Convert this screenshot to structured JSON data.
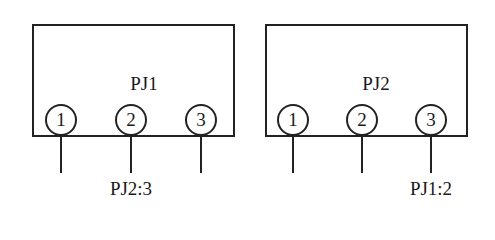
{
  "connectors": [
    {
      "name": "PJ1",
      "pins": [
        "1",
        "2",
        "3"
      ],
      "wire_labels": [
        "",
        "PJ2:3",
        ""
      ]
    },
    {
      "name": "PJ2",
      "pins": [
        "1",
        "2",
        "3"
      ],
      "wire_labels": [
        "",
        "",
        "PJ1:2"
      ]
    }
  ]
}
